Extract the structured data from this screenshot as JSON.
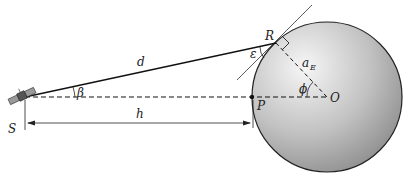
{
  "diagram": {
    "labels": {
      "satellite": "S",
      "slant_range": "d",
      "altitude": "h",
      "nadir_point": "P",
      "ground_point": "R",
      "earth_center": "O",
      "earth_radius": "a",
      "earth_radius_sub": "E",
      "nadir_angle": "β",
      "elevation_angle": "ε",
      "central_angle": "ϕ"
    },
    "colors": {
      "sphere_light": "#f4f4f4",
      "sphere_dark": "#8c8c8c",
      "line": "#222222"
    }
  }
}
